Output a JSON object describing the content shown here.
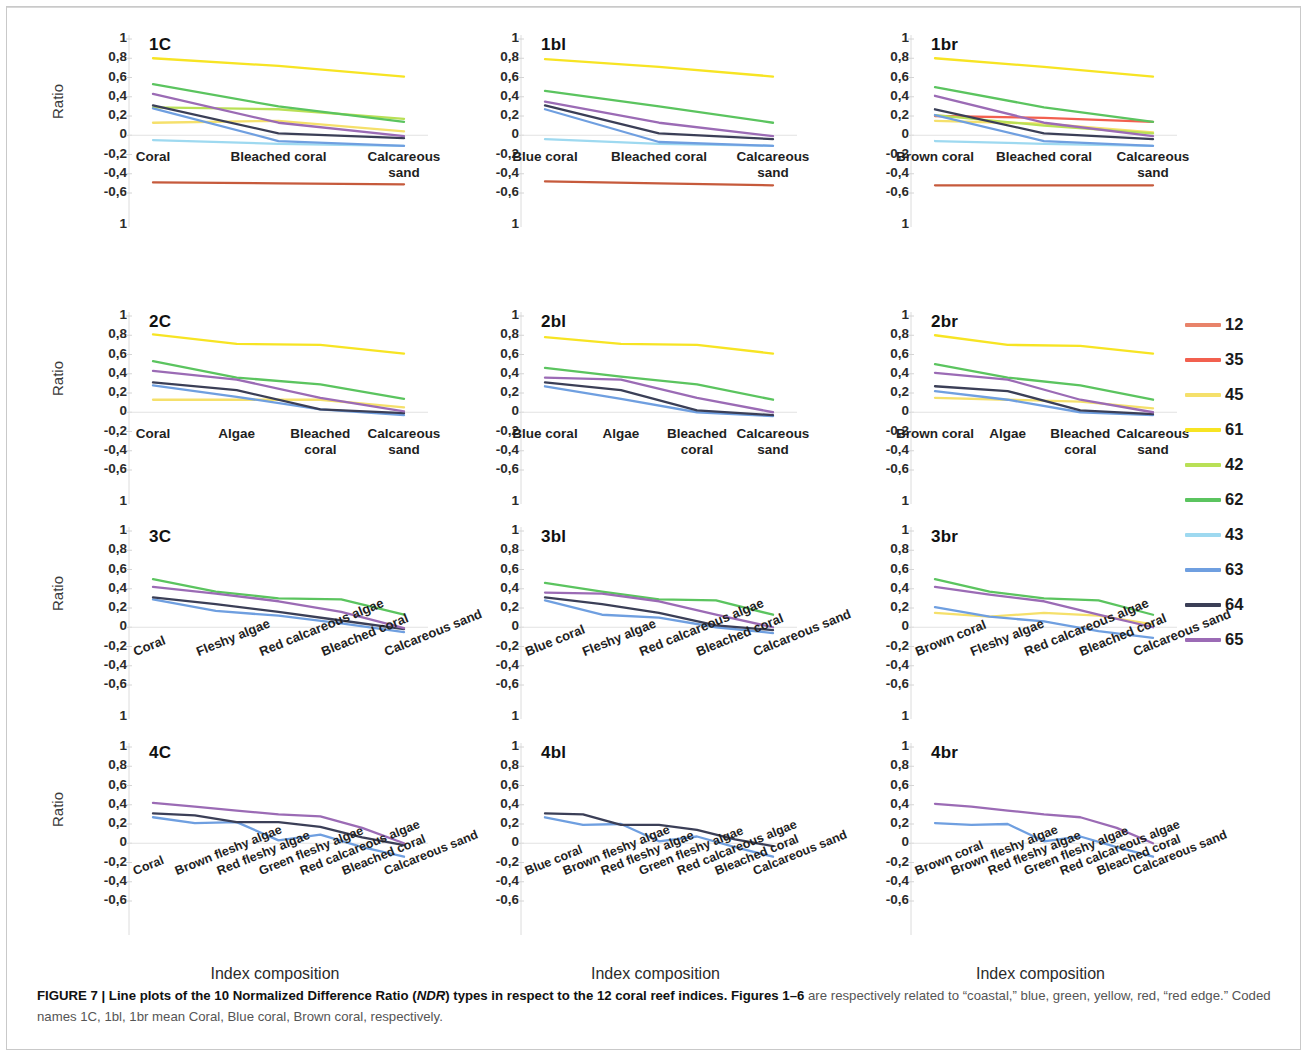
{
  "figure": {
    "y_axis_title": "Ratio",
    "x_axis_title": "Index composition",
    "y_ticks": [
      "1",
      "0,8",
      "0,6",
      "0,4",
      "0,2",
      "0",
      "-0,2",
      "-0,4",
      "-0,6"
    ],
    "ylim": [
      -0.6,
      1.0
    ]
  },
  "caption": {
    "figure_label": "FIGURE 7 |",
    "bold_text": "Line plots of the 10 Normalized Difference Ratio (NDR) types in respect to the 12 coral reef indices. Figures 1–6",
    "italic_token": "NDR",
    "rest_text": " are respectively related to “coastal,” blue, green, yellow, red, “red edge.” Coded names 1C, 1bl, 1br mean Coral, Blue coral, Brown coral, respectively."
  },
  "legend": {
    "entries": [
      {
        "label": "12",
        "color": "#e8836a"
      },
      {
        "label": "35",
        "color": "#f2604f"
      },
      {
        "label": "45",
        "color": "#f5e06b"
      },
      {
        "label": "61",
        "color": "#f7e423"
      },
      {
        "label": "42",
        "color": "#b9e056"
      },
      {
        "label": "62",
        "color": "#5bc45f"
      },
      {
        "label": "43",
        "color": "#9ed9f0"
      },
      {
        "label": "63",
        "color": "#6f9fe0"
      },
      {
        "label": "64",
        "color": "#3b3f57"
      },
      {
        "label": "65",
        "color": "#9b6bb5"
      }
    ]
  },
  "chart_data": [
    {
      "id": "1C",
      "type": "line",
      "title": "1C",
      "xlabel": "",
      "ylabel": "Ratio",
      "ylim": [
        -0.6,
        1.0
      ],
      "grid": false,
      "legend_position": "right-outside",
      "categories": [
        "Coral",
        "Bleached coral",
        "Calcareous sand"
      ],
      "series": [
        {
          "name": "12",
          "color": "#c65a3c",
          "values": [
            -0.49,
            -0.5,
            -0.51
          ]
        },
        {
          "name": "45",
          "color": "#f5e06b",
          "values": [
            0.13,
            0.15,
            0.04
          ]
        },
        {
          "name": "61",
          "color": "#f7e423",
          "values": [
            0.8,
            0.72,
            0.61
          ]
        },
        {
          "name": "42",
          "color": "#b9e056",
          "values": [
            0.29,
            0.27,
            0.17
          ]
        },
        {
          "name": "62",
          "color": "#5bc45f",
          "values": [
            0.53,
            0.3,
            0.14
          ]
        },
        {
          "name": "43",
          "color": "#9ed9f0",
          "values": [
            -0.05,
            -0.09,
            -0.11
          ]
        },
        {
          "name": "63",
          "color": "#6f9fe0",
          "values": [
            0.28,
            -0.06,
            -0.11
          ]
        },
        {
          "name": "64",
          "color": "#3b3f57",
          "values": [
            0.31,
            0.02,
            -0.03
          ]
        },
        {
          "name": "65",
          "color": "#9b6bb5",
          "values": [
            0.43,
            0.13,
            -0.01
          ]
        }
      ]
    },
    {
      "id": "1bl",
      "type": "line",
      "title": "1bl",
      "xlabel": "",
      "ylabel": "Ratio",
      "ylim": [
        -0.6,
        1.0
      ],
      "grid": false,
      "legend_position": "right-outside",
      "categories": [
        "Blue coral",
        "Bleached coral",
        "Calcareous sand"
      ],
      "series": [
        {
          "name": "12",
          "color": "#c65a3c",
          "values": [
            -0.48,
            -0.5,
            -0.52
          ]
        },
        {
          "name": "61",
          "color": "#f7e423",
          "values": [
            0.79,
            0.71,
            0.61
          ]
        },
        {
          "name": "62",
          "color": "#5bc45f",
          "values": [
            0.46,
            0.3,
            0.13
          ]
        },
        {
          "name": "43",
          "color": "#9ed9f0",
          "values": [
            -0.04,
            -0.09,
            -0.11
          ]
        },
        {
          "name": "63",
          "color": "#6f9fe0",
          "values": [
            0.27,
            -0.07,
            -0.11
          ]
        },
        {
          "name": "64",
          "color": "#3b3f57",
          "values": [
            0.31,
            0.02,
            -0.04
          ]
        },
        {
          "name": "65",
          "color": "#9b6bb5",
          "values": [
            0.35,
            0.13,
            -0.01
          ]
        }
      ]
    },
    {
      "id": "1br",
      "type": "line",
      "title": "1br",
      "xlabel": "",
      "ylabel": "Ratio",
      "ylim": [
        -0.6,
        1.0
      ],
      "grid": false,
      "legend_position": "right-outside",
      "categories": [
        "Brown coral",
        "Bleached coral",
        "Calcareous sand"
      ],
      "series": [
        {
          "name": "12",
          "color": "#c65a3c",
          "values": [
            -0.52,
            -0.52,
            -0.52
          ]
        },
        {
          "name": "35",
          "color": "#f2604f",
          "values": [
            0.2,
            0.18,
            0.14
          ]
        },
        {
          "name": "45",
          "color": "#f5e06b",
          "values": [
            0.15,
            0.12,
            0.03
          ]
        },
        {
          "name": "61",
          "color": "#f7e423",
          "values": [
            0.8,
            0.71,
            0.61
          ]
        },
        {
          "name": "42",
          "color": "#b9e056",
          "values": [
            0.21,
            0.1,
            0.02
          ]
        },
        {
          "name": "62",
          "color": "#5bc45f",
          "values": [
            0.5,
            0.29,
            0.14
          ]
        },
        {
          "name": "43",
          "color": "#9ed9f0",
          "values": [
            -0.06,
            -0.09,
            -0.11
          ]
        },
        {
          "name": "63",
          "color": "#6f9fe0",
          "values": [
            0.21,
            -0.06,
            -0.11
          ]
        },
        {
          "name": "64",
          "color": "#3b3f57",
          "values": [
            0.27,
            0.02,
            -0.04
          ]
        },
        {
          "name": "65",
          "color": "#9b6bb5",
          "values": [
            0.41,
            0.13,
            -0.01
          ]
        }
      ]
    },
    {
      "id": "2C",
      "type": "line",
      "title": "2C",
      "xlabel": "",
      "ylabel": "Ratio",
      "ylim": [
        -0.6,
        1.0
      ],
      "grid": false,
      "legend_position": "right-outside",
      "categories": [
        "Coral",
        "Algae",
        "Bleached coral",
        "Calcareous sand"
      ],
      "series": [
        {
          "name": "45",
          "color": "#f5e06b",
          "values": [
            0.13,
            0.13,
            0.13,
            0.05
          ]
        },
        {
          "name": "61",
          "color": "#f7e423",
          "values": [
            0.81,
            0.71,
            0.7,
            0.61
          ]
        },
        {
          "name": "62",
          "color": "#5bc45f",
          "values": [
            0.53,
            0.36,
            0.29,
            0.14
          ]
        },
        {
          "name": "63",
          "color": "#6f9fe0",
          "values": [
            0.28,
            0.16,
            0.03,
            -0.03
          ]
        },
        {
          "name": "64",
          "color": "#3b3f57",
          "values": [
            0.31,
            0.23,
            0.03,
            -0.01
          ]
        },
        {
          "name": "65",
          "color": "#9b6bb5",
          "values": [
            0.43,
            0.34,
            0.15,
            0.01
          ]
        }
      ]
    },
    {
      "id": "2bl",
      "type": "line",
      "title": "2bl",
      "xlabel": "",
      "ylabel": "Ratio",
      "ylim": [
        -0.6,
        1.0
      ],
      "grid": false,
      "legend_position": "right-outside",
      "categories": [
        "Blue coral",
        "Algae",
        "Bleached coral",
        "Calcareous sand"
      ],
      "series": [
        {
          "name": "61",
          "color": "#f7e423",
          "values": [
            0.78,
            0.71,
            0.7,
            0.61
          ]
        },
        {
          "name": "62",
          "color": "#5bc45f",
          "values": [
            0.46,
            0.37,
            0.29,
            0.13
          ]
        },
        {
          "name": "63",
          "color": "#6f9fe0",
          "values": [
            0.27,
            0.14,
            0.0,
            -0.04
          ]
        },
        {
          "name": "64",
          "color": "#3b3f57",
          "values": [
            0.31,
            0.23,
            0.02,
            -0.03
          ]
        },
        {
          "name": "65",
          "color": "#9b6bb5",
          "values": [
            0.36,
            0.34,
            0.15,
            0.0
          ]
        }
      ]
    },
    {
      "id": "2br",
      "type": "line",
      "title": "2br",
      "xlabel": "",
      "ylabel": "Ratio",
      "ylim": [
        -0.6,
        1.0
      ],
      "grid": false,
      "legend_position": "right-outside",
      "categories": [
        "Brown coral",
        "Algae",
        "Bleached coral",
        "Calcareous sand"
      ],
      "series": [
        {
          "name": "45",
          "color": "#f5e06b",
          "values": [
            0.15,
            0.13,
            0.11,
            0.04
          ]
        },
        {
          "name": "61",
          "color": "#f7e423",
          "values": [
            0.8,
            0.7,
            0.69,
            0.61
          ]
        },
        {
          "name": "62",
          "color": "#5bc45f",
          "values": [
            0.5,
            0.36,
            0.28,
            0.13
          ]
        },
        {
          "name": "63",
          "color": "#6f9fe0",
          "values": [
            0.22,
            0.13,
            0.0,
            -0.03
          ]
        },
        {
          "name": "64",
          "color": "#3b3f57",
          "values": [
            0.27,
            0.22,
            0.02,
            -0.02
          ]
        },
        {
          "name": "65",
          "color": "#9b6bb5",
          "values": [
            0.41,
            0.34,
            0.13,
            0.0
          ]
        }
      ]
    },
    {
      "id": "3C",
      "type": "line",
      "title": "3C",
      "xlabel": "",
      "ylabel": "Ratio",
      "ylim": [
        -0.6,
        1.0
      ],
      "grid": false,
      "legend_position": "right-outside",
      "categories": [
        "Coral",
        "Fleshy algae",
        "Red calcareous algae",
        "Bleached coral",
        "Calcareous sand"
      ],
      "series": [
        {
          "name": "62",
          "color": "#5bc45f",
          "values": [
            0.5,
            0.37,
            0.3,
            0.29,
            0.13
          ]
        },
        {
          "name": "63",
          "color": "#6f9fe0",
          "values": [
            0.29,
            0.17,
            0.12,
            0.04,
            -0.05
          ]
        },
        {
          "name": "64",
          "color": "#3b3f57",
          "values": [
            0.31,
            0.24,
            0.16,
            0.07,
            -0.02
          ]
        },
        {
          "name": "65",
          "color": "#9b6bb5",
          "values": [
            0.42,
            0.35,
            0.27,
            0.16,
            -0.01
          ]
        }
      ]
    },
    {
      "id": "3bl",
      "type": "line",
      "title": "3bl",
      "xlabel": "",
      "ylabel": "Ratio",
      "ylim": [
        -0.6,
        1.0
      ],
      "grid": false,
      "legend_position": "right-outside",
      "categories": [
        "Blue coral",
        "Fleshy algae",
        "Red calcareous algae",
        "Bleached coral",
        "Calcareous sand"
      ],
      "series": [
        {
          "name": "62",
          "color": "#5bc45f",
          "values": [
            0.46,
            0.37,
            0.29,
            0.28,
            0.13
          ]
        },
        {
          "name": "63",
          "color": "#6f9fe0",
          "values": [
            0.28,
            0.13,
            0.1,
            0.0,
            -0.06
          ]
        },
        {
          "name": "64",
          "color": "#3b3f57",
          "values": [
            0.31,
            0.24,
            0.15,
            0.02,
            -0.03
          ]
        },
        {
          "name": "65",
          "color": "#9b6bb5",
          "values": [
            0.36,
            0.35,
            0.27,
            0.13,
            0.0
          ]
        }
      ]
    },
    {
      "id": "3br",
      "type": "line",
      "title": "3br",
      "xlabel": "",
      "ylabel": "Ratio",
      "ylim": [
        -0.6,
        1.0
      ],
      "grid": false,
      "legend_position": "right-outside",
      "categories": [
        "Brown coral",
        "Fleshy algae",
        "Red calcareous algae",
        "Bleached coral",
        "Calcareous sand"
      ],
      "series": [
        {
          "name": "45",
          "color": "#f5e06b",
          "values": [
            0.15,
            0.11,
            0.15,
            0.12,
            0.03
          ]
        },
        {
          "name": "62",
          "color": "#5bc45f",
          "values": [
            0.5,
            0.37,
            0.3,
            0.28,
            0.13
          ]
        },
        {
          "name": "63",
          "color": "#6f9fe0",
          "values": [
            0.21,
            0.11,
            0.06,
            -0.04,
            -0.11
          ]
        },
        {
          "name": "65",
          "color": "#9b6bb5",
          "values": [
            0.42,
            0.34,
            0.27,
            0.13,
            0.0
          ]
        }
      ]
    },
    {
      "id": "4C",
      "type": "line",
      "title": "4C",
      "xlabel": "Index composition",
      "ylabel": "Ratio",
      "ylim": [
        -0.6,
        1.0
      ],
      "grid": false,
      "legend_position": "right-outside",
      "categories": [
        "Coral",
        "Brown fleshy algae",
        "Red fleshy algae",
        "Green fleshy algae",
        "Red calcareous algae",
        "Bleached coral",
        "Calcareous sand"
      ],
      "series": [
        {
          "name": "63",
          "color": "#6f9fe0",
          "values": [
            0.27,
            0.21,
            0.22,
            0.03,
            0.09,
            -0.04,
            -0.14
          ]
        },
        {
          "name": "64",
          "color": "#3b3f57",
          "values": [
            0.31,
            0.29,
            0.22,
            0.22,
            0.17,
            0.06,
            -0.02
          ]
        },
        {
          "name": "65",
          "color": "#9b6bb5",
          "values": [
            0.42,
            0.38,
            0.34,
            0.3,
            0.28,
            0.16,
            0.0
          ]
        }
      ]
    },
    {
      "id": "4bl",
      "type": "line",
      "title": "4bl",
      "xlabel": "Index composition",
      "ylabel": "Ratio",
      "ylim": [
        -0.6,
        1.0
      ],
      "grid": false,
      "legend_position": "right-outside",
      "categories": [
        "Blue coral",
        "Brown fleshy algae",
        "Red fleshy algae",
        "Green fleshy algae",
        "Red calcareous algae",
        "Bleached coral",
        "Calcareous sand"
      ],
      "series": [
        {
          "name": "63",
          "color": "#6f9fe0",
          "values": [
            0.27,
            0.19,
            0.2,
            0.02,
            0.07,
            -0.04,
            -0.14
          ]
        },
        {
          "name": "64",
          "color": "#3b3f57",
          "values": [
            0.31,
            0.3,
            0.19,
            0.19,
            0.14,
            0.04,
            -0.03
          ]
        }
      ]
    },
    {
      "id": "4br",
      "type": "line",
      "title": "4br",
      "xlabel": "Index composition",
      "ylabel": "Ratio",
      "ylim": [
        -0.6,
        1.0
      ],
      "grid": false,
      "legend_position": "right-outside",
      "categories": [
        "Brown coral",
        "Brown fleshy algae",
        "Red fleshy algae",
        "Green fleshy algae",
        "Red calcareous algae",
        "Bleached coral",
        "Calcareous sand"
      ],
      "series": [
        {
          "name": "63",
          "color": "#6f9fe0",
          "values": [
            0.21,
            0.19,
            0.2,
            0.02,
            0.07,
            -0.04,
            -0.14
          ]
        },
        {
          "name": "65",
          "color": "#9b6bb5",
          "values": [
            0.41,
            0.38,
            0.34,
            0.3,
            0.27,
            0.16,
            0.0
          ]
        }
      ]
    }
  ],
  "panels_layout": [
    {
      "id": "1C",
      "col": 0,
      "row": 0
    },
    {
      "id": "1bl",
      "col": 1,
      "row": 0
    },
    {
      "id": "1br",
      "col": 2,
      "row": 0
    },
    {
      "id": "2C",
      "col": 0,
      "row": 1
    },
    {
      "id": "2bl",
      "col": 1,
      "row": 1
    },
    {
      "id": "2br",
      "col": 2,
      "row": 1
    },
    {
      "id": "3C",
      "col": 0,
      "row": 2
    },
    {
      "id": "3bl",
      "col": 1,
      "row": 2
    },
    {
      "id": "3br",
      "col": 2,
      "row": 2
    },
    {
      "id": "4C",
      "col": 0,
      "row": 3
    },
    {
      "id": "4bl",
      "col": 1,
      "row": 3
    },
    {
      "id": "4br",
      "col": 2,
      "row": 3
    }
  ]
}
